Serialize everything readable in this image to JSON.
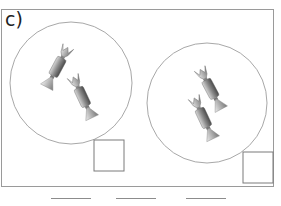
{
  "exercise": {
    "label": "c)",
    "groups": [
      {
        "name": "group-1",
        "circle": {
          "cx": 71,
          "cy": 83,
          "r": 61
        },
        "candy_count": 2,
        "answer_box": {
          "x": 94,
          "y": 140,
          "w": 30,
          "h": 31,
          "value": ""
        }
      },
      {
        "name": "group-2",
        "circle": {
          "cx": 207,
          "cy": 103,
          "r": 60
        },
        "candy_count": 2,
        "answer_box": {
          "x": 243,
          "y": 152,
          "w": 30,
          "h": 31,
          "value": ""
        }
      }
    ],
    "blanks": [
      {
        "x": 51,
        "width": 40,
        "value": ""
      },
      {
        "x": 116,
        "width": 40,
        "value": ""
      },
      {
        "x": 186,
        "width": 40,
        "value": ""
      }
    ],
    "icons": [
      "candy-icon"
    ],
    "colors": {
      "stroke": "#9a9a9a",
      "candy_dark": "#555555",
      "candy_light": "#e6e6e6"
    }
  }
}
